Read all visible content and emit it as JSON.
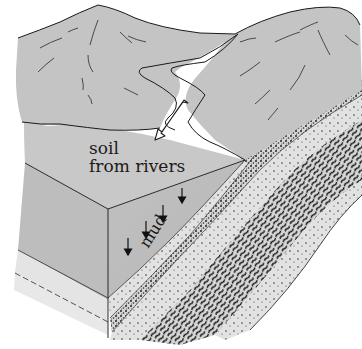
{
  "diagram": {
    "labels": {
      "soil_line1": "soil",
      "soil_line2": "from rivers",
      "mud": "mud"
    },
    "elements": {
      "mountains": "mountain range with river valley",
      "river": "river flowing down from mountains",
      "arrow": "hollow arrow pointing from river to sea floor",
      "block": "cut-away block showing sediment layers",
      "down_arrows": 4,
      "layers": [
        "mud",
        "sand",
        "fine gravel",
        "sand",
        "coarse gravel",
        "sand"
      ]
    },
    "colors": {
      "mountain_fill": "#c4c4c4",
      "sea_fill": "#c8c8c8",
      "block_face": "#bdbdbd",
      "sand_layer": "#e0e0e0",
      "outline": "#1a1a1a",
      "background": "#ffffff"
    }
  }
}
